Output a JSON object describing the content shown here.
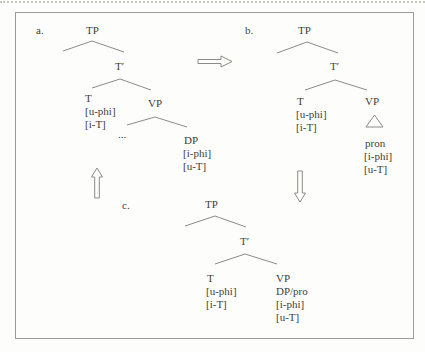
{
  "figure": {
    "colors": {
      "background": "#fdfdfb",
      "border": "#9c9c96",
      "line": "#8b8b85",
      "text": "#3e3e39",
      "dotted_rule": "#c6c6be"
    },
    "trees": {
      "a": {
        "label": "a.",
        "root": "TP",
        "tbar": "T′",
        "t_head": "T",
        "t_features": [
          "[u-phi]",
          "[i-T]"
        ],
        "vp": "VP",
        "spec_ellipsis": "...",
        "object": "DP",
        "object_features": [
          "[i-phi]",
          "[u-T]"
        ]
      },
      "b": {
        "label": "b.",
        "root": "TP",
        "tbar": "T′",
        "t_head": "T",
        "t_features": [
          "[u-phi]",
          "[i-T]"
        ],
        "vp": "VP",
        "pron": "pron",
        "pron_features": [
          "[i-phi]",
          "[u-T]"
        ]
      },
      "c": {
        "label": "c.",
        "root": "TP",
        "tbar": "T′",
        "t_head": "T",
        "t_features": [
          "[u-phi]",
          "[i-T]"
        ],
        "vp": "VP",
        "dp_pro": "DP/pro",
        "dp_pro_features": [
          "[i-phi]",
          "[u-T]"
        ]
      }
    },
    "arrows": {
      "right": "rightward-block-arrow",
      "up": "upward-block-arrow",
      "down": "downward-block-arrow"
    }
  }
}
